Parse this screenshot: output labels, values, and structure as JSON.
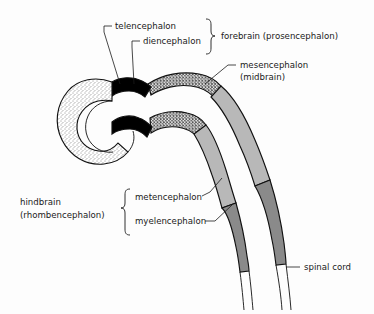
{
  "figure": {
    "background_color": "#fdfdfd",
    "ink_color": "#1a1a1a"
  },
  "labels": {
    "telencephalon": "telencephalon",
    "diencephalon": "diencephalon",
    "forebrain": "forebrain (prosencephalon)",
    "mesencephalon_line1": "mesencephalon",
    "mesencephalon_line2": "(midbrain)",
    "hindbrain_line1": "hindbrain",
    "hindbrain_line2": "(rhombencephalon)",
    "metencephalon": "metencephalon",
    "myelencephalon": "myelencephalon",
    "spinal_cord": "spinal cord"
  },
  "brackets": {
    "forebrain_members": [
      "telencephalon",
      "diencephalon"
    ],
    "hindbrain_members": [
      "metencephalon",
      "myelencephalon"
    ]
  },
  "regions": [
    {
      "name": "telencephalon",
      "fill_style": "fine-stipple",
      "color": "#ffffff",
      "description": "C-shaped crescent bulb opening rightward"
    },
    {
      "name": "diencephalon",
      "fill_style": "solid",
      "color": "#000000",
      "description": "solid black band behind telencephalon"
    },
    {
      "name": "mesencephalon",
      "fill_style": "coarse-stipple",
      "color": "#ffffff",
      "description": "densely speckled arching segment"
    },
    {
      "name": "metencephalon",
      "fill_style": "solid",
      "color": "#b8b8b8",
      "description": "light gray elongated segment"
    },
    {
      "name": "myelencephalon",
      "fill_style": "solid",
      "color": "#8a8a8a",
      "description": "darker gray tapering segment"
    },
    {
      "name": "spinal cord",
      "fill_style": "outline",
      "color": "#ffffff",
      "description": "thin unfilled tube tapering downward"
    }
  ],
  "colors": {
    "black": "#000000",
    "light_gray": "#b8b8b8",
    "dark_gray": "#8a8a8a",
    "outline": "#111111",
    "paper": "#fdfdfd"
  }
}
